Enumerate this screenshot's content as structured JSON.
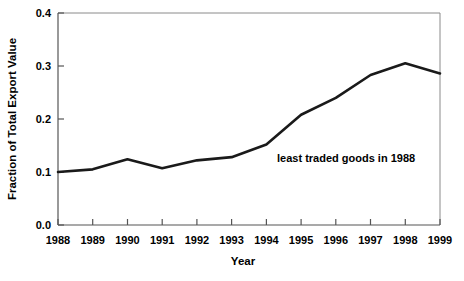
{
  "chart_data": {
    "type": "line",
    "title": "",
    "xlabel": "Year",
    "ylabel": "Fraction of Total Export Value",
    "categories": [
      "1988",
      "1989",
      "1990",
      "1991",
      "1992",
      "1993",
      "1994",
      "1995",
      "1996",
      "1997",
      "1998",
      "1999"
    ],
    "x": [
      1988,
      1989,
      1990,
      1991,
      1992,
      1993,
      1994,
      1995,
      1996,
      1997,
      1998,
      1999
    ],
    "values": [
      0.1,
      0.105,
      0.124,
      0.107,
      0.122,
      0.128,
      0.152,
      0.208,
      0.24,
      0.283,
      0.305,
      0.286
    ],
    "series": [
      {
        "name": "least traded goods in 1988",
        "values": [
          0.1,
          0.105,
          0.124,
          0.107,
          0.122,
          0.128,
          0.152,
          0.208,
          0.24,
          0.283,
          0.305,
          0.286
        ]
      }
    ],
    "ylim": [
      0.0,
      0.4
    ],
    "xlim": [
      1988,
      1999
    ],
    "yticks": [
      0.0,
      0.1,
      0.2,
      0.3,
      0.4
    ],
    "ytick_labels": [
      "0.0",
      "0.1",
      "0.2",
      "0.3",
      "0.4"
    ],
    "xtick_labels": [
      "1988",
      "1989",
      "1990",
      "1991",
      "1992",
      "1993",
      "1994",
      "1995",
      "1996",
      "1997",
      "1998",
      "1999"
    ],
    "grid": false,
    "legend": "none",
    "annotations": [
      {
        "text": "least traded goods in 1988",
        "x": 1994.4,
        "y": 0.158
      }
    ],
    "line_color": "#1a1a1a",
    "frame_color": "#8a8a8a",
    "background_color": "#ffffff"
  },
  "axes": {
    "y_title": "Fraction of Total Export Value",
    "x_title": "Year",
    "ytick_0": "0.0",
    "ytick_1": "0.1",
    "ytick_2": "0.2",
    "ytick_3": "0.3",
    "ytick_4": "0.4"
  },
  "annotation": {
    "label": "least traded goods in 1988"
  }
}
